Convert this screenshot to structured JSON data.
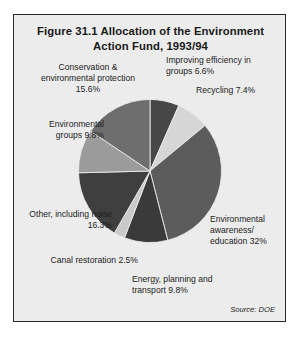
{
  "figure": {
    "title": "Figure 31.1  Allocation of the Environment Action Fund, 1993/94",
    "source_note": "Source: DOE"
  },
  "labels": {
    "conservation": "Conservation & environmental protection 15.6%",
    "improving": "Improving efficiency in groups 6.6%",
    "recycling": "Recycling 7.4%",
    "envgroups": "Environmental groups 9.8%",
    "other": "Other, including noise 16.3%",
    "canal": "Canal restoration 2.5%",
    "awareness": "Environmental awareness/ education 32%",
    "energy": "Energy, planning and transport 9.8%"
  },
  "chart_data": {
    "type": "pie",
    "title": "Figure 31.1  Allocation of the Environment Action Fund, 1993/94",
    "source": "Source: DOE",
    "unit": "percent",
    "start_angle_deg": 0,
    "direction": "clockwise",
    "legend": "labels-around-slices",
    "total": 100.0,
    "categories": [
      "Improving efficiency in groups",
      "Recycling",
      "Environmental awareness/ education",
      "Energy, planning and transport",
      "Canal restoration",
      "Other, including noise",
      "Environmental groups",
      "Conservation & environmental protection"
    ],
    "values": [
      6.6,
      7.4,
      32.0,
      9.8,
      2.5,
      16.3,
      9.8,
      15.6
    ],
    "colors": [
      "#474747",
      "#d6d6d6",
      "#5c5c5c",
      "#3a3a3a",
      "#c9c9c9",
      "#3f3f3f",
      "#9b9b9b",
      "#6e6e6e"
    ],
    "slices": [
      {
        "label": "Improving efficiency in groups",
        "value": 6.6,
        "color": "#474747"
      },
      {
        "label": "Recycling",
        "value": 7.4,
        "color": "#d6d6d6"
      },
      {
        "label": "Environmental awareness/ education",
        "value": 32.0,
        "color": "#5c5c5c"
      },
      {
        "label": "Energy, planning and transport",
        "value": 9.8,
        "color": "#3a3a3a"
      },
      {
        "label": "Canal restoration",
        "value": 2.5,
        "color": "#c9c9c9"
      },
      {
        "label": "Other, including noise",
        "value": 16.3,
        "color": "#3f3f3f"
      },
      {
        "label": "Environmental groups",
        "value": 9.8,
        "color": "#9b9b9b"
      },
      {
        "label": "Conservation & environmental protection",
        "value": 15.6,
        "color": "#6e6e6e"
      }
    ]
  }
}
